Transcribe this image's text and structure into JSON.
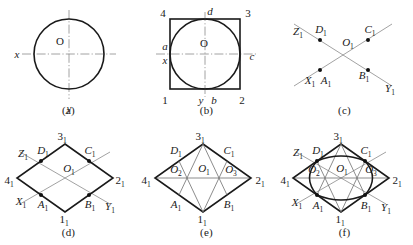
{
  "figure": {
    "panels": [
      {
        "id": "a",
        "caption": "(a)",
        "title": "circle with x and y centre lines",
        "labels": {
          "origin": "O",
          "x_axis": "x",
          "y_axis": "y"
        }
      },
      {
        "id": "b",
        "caption": "(b)",
        "title": "circle enclosed in square 1 2 3 4 with tangent points a b c d",
        "labels": {
          "origin": "O",
          "x_axis": "x",
          "y_axis": "y",
          "corner_bottom_left": "1",
          "corner_bottom_right": "2",
          "corner_top_right": "3",
          "corner_top_left": "4",
          "tangent_left": "a",
          "tangent_bottom": "b",
          "tangent_right": "c",
          "tangent_top": "d"
        }
      },
      {
        "id": "c",
        "caption": "(c)",
        "title": "isometric axes X1 Y1 Z1 through O1 with points A1 B1 C1 D1",
        "labels": {
          "origin": "O",
          "origin_sub": "1",
          "axis_x": "X",
          "axis_x_sub": "1",
          "axis_y": "Y",
          "axis_y_sub": "1",
          "axis_z": "Z",
          "axis_z_sub": "1",
          "point_a": "A",
          "point_a_sub": "1",
          "point_b": "B",
          "point_b_sub": "1",
          "point_c": "C",
          "point_c_sub": "1",
          "point_d": "D",
          "point_d_sub": "1"
        }
      },
      {
        "id": "d",
        "caption": "(d)",
        "title": "isometric rhombus 1 2 3 4 with axes and tangent points",
        "labels": {
          "origin": "O",
          "origin_sub": "1",
          "axis_x": "X",
          "axis_x_sub": "1",
          "axis_y": "Y",
          "axis_y_sub": "1",
          "axis_z": "Z",
          "axis_z_sub": "1",
          "point_a": "A",
          "point_a_sub": "1",
          "point_b": "B",
          "point_b_sub": "1",
          "point_c": "C",
          "point_c_sub": "1",
          "point_d": "D",
          "point_d_sub": "1",
          "corner_bottom": "1",
          "corner_bottom_sub": "1",
          "corner_right": "2",
          "corner_right_sub": "1",
          "corner_top": "3",
          "corner_top_sub": "1",
          "corner_left": "4",
          "corner_left_sub": "1"
        }
      },
      {
        "id": "e",
        "caption": "(e)",
        "title": "four-centre construction lines locating centres O2 and O3",
        "labels": {
          "centre_1": "O",
          "centre_1_sub": "1",
          "centre_2": "O",
          "centre_2_sub": "2",
          "centre_3": "O",
          "centre_3_sub": "3",
          "point_a": "A",
          "point_a_sub": "1",
          "point_b": "B",
          "point_b_sub": "1",
          "point_c": "C",
          "point_c_sub": "1",
          "point_d": "D",
          "point_d_sub": "1",
          "corner_bottom": "1",
          "corner_bottom_sub": "1",
          "corner_right": "2",
          "corner_right_sub": "1",
          "corner_top": "3",
          "corner_top_sub": "1",
          "corner_left": "4",
          "corner_left_sub": "1"
        }
      },
      {
        "id": "f",
        "caption": "(f)",
        "title": "completed four-centre isometric ellipse inscribed in the rhombus",
        "labels": {
          "centre_1": "O",
          "centre_1_sub": "1",
          "centre_2": "O",
          "centre_2_sub": "2",
          "centre_3": "O",
          "centre_3_sub": "3",
          "axis_x": "X",
          "axis_x_sub": "1",
          "axis_y": "Y",
          "axis_y_sub": "1",
          "axis_z": "Z",
          "axis_z_sub": "1",
          "point_a": "A",
          "point_a_sub": "1",
          "point_b": "B",
          "point_b_sub": "1",
          "point_c": "C",
          "point_c_sub": "1",
          "point_d": "D",
          "point_d_sub": "1",
          "corner_bottom": "1",
          "corner_bottom_sub": "1",
          "corner_right": "2",
          "corner_right_sub": "1",
          "corner_top": "3",
          "corner_top_sub": "1",
          "corner_left": "4",
          "corner_left_sub": "1"
        }
      }
    ],
    "colors": {
      "ink": "#1a1a1a",
      "construction": "#8a8a8a",
      "background": "#ffffff"
    }
  }
}
